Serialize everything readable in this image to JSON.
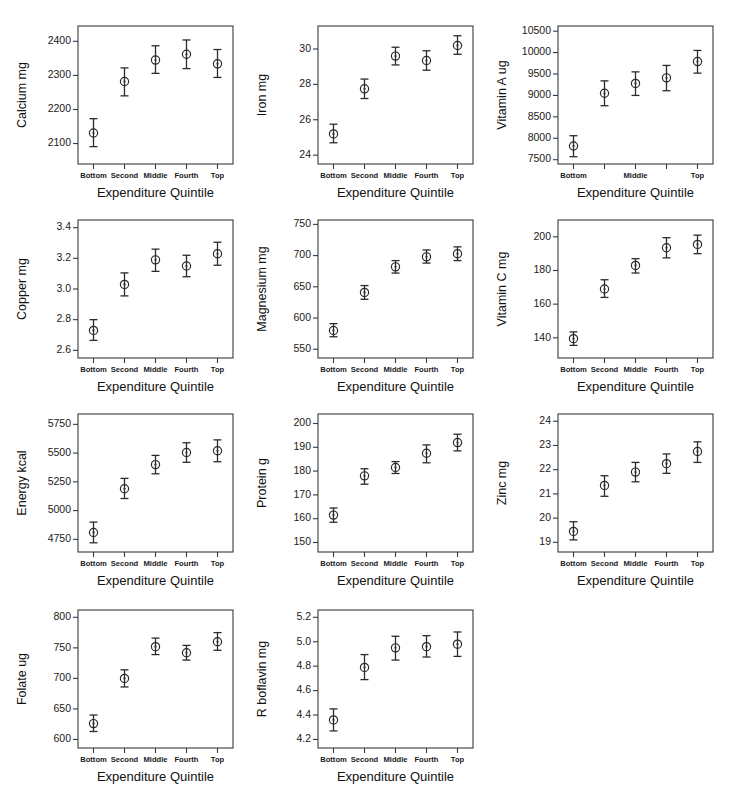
{
  "figure": {
    "layout": {
      "columns": 3,
      "rows": 4,
      "panel_count": 11,
      "empty_cells": [
        11
      ]
    },
    "shared_xlabel": "Expenditure Quintile",
    "shared_categories": [
      "Bottom",
      "Second",
      "Middle",
      "Fourth",
      "Top"
    ],
    "marker": "open-circle-with-center-dot",
    "error_bars": "capped-vertical",
    "grid": false,
    "legend": null,
    "colors": {
      "ink": "#2b2b2b",
      "axis": "#3a3a3a",
      "background": "#ffffff"
    }
  },
  "chart_data": [
    {
      "type": "scatter",
      "title": "",
      "xlabel": "Expenditure Quintile",
      "ylabel": "Calcium mg",
      "categories": [
        "Bottom",
        "Second",
        "Middle",
        "Fourth",
        "Top"
      ],
      "xtick_labels": [
        "Bottom",
        "Second",
        "Middle",
        "Fourth",
        "Top"
      ],
      "values": [
        2131,
        2282,
        2345,
        2362,
        2334
      ],
      "err_low": [
        2091,
        2240,
        2306,
        2320,
        2294
      ],
      "err_high": [
        2173,
        2322,
        2387,
        2404,
        2376
      ],
      "ylim": [
        2040,
        2445
      ],
      "yticks": [
        2100,
        2200,
        2300,
        2400
      ],
      "ytick_labels": [
        "2100",
        "2200",
        "2300",
        "2400"
      ]
    },
    {
      "type": "scatter",
      "title": "",
      "xlabel": "Expenditure Quintile",
      "ylabel": "Iron mg",
      "categories": [
        "Bottom",
        "Second",
        "Middle",
        "Fourth",
        "Top"
      ],
      "xtick_labels": [
        "Bottom",
        "Second",
        "Middle",
        "Fourth",
        "Top"
      ],
      "values": [
        25.2,
        27.75,
        29.6,
        29.35,
        30.2
      ],
      "err_low": [
        24.7,
        27.2,
        29.1,
        28.8,
        29.7
      ],
      "err_high": [
        25.75,
        28.3,
        30.1,
        29.9,
        30.75
      ],
      "ylim": [
        23.5,
        31.3
      ],
      "yticks": [
        24,
        26,
        28,
        30
      ],
      "ytick_labels": [
        "24",
        "26",
        "28",
        "30"
      ]
    },
    {
      "type": "scatter",
      "title": "",
      "xlabel": "Expenditure Quintile",
      "ylabel": "Vitamin A ug",
      "categories": [
        "Bottom",
        "Second",
        "Middle",
        "Fourth",
        "Top"
      ],
      "xtick_labels": [
        "Bottom",
        "",
        "Middle",
        "",
        "Top"
      ],
      "values": [
        7820,
        9050,
        9280,
        9410,
        9790
      ],
      "err_low": [
        7570,
        8760,
        9000,
        9110,
        9520
      ],
      "err_high": [
        8060,
        9340,
        9550,
        9700,
        10050
      ],
      "ylim": [
        7400,
        10620
      ],
      "yticks": [
        7500,
        8000,
        8500,
        9000,
        9500,
        10000,
        10500
      ],
      "ytick_labels": [
        "7500",
        "8000",
        "8500",
        "9000",
        "9500",
        "10000",
        "10500"
      ]
    },
    {
      "type": "scatter",
      "title": "",
      "xlabel": "Expenditure Quintile",
      "ylabel": "Copper mg",
      "categories": [
        "Bottom",
        "Second",
        "Middle",
        "Fourth",
        "Top"
      ],
      "xtick_labels": [
        "Bottom",
        "Second",
        "Middle",
        "Fourth",
        "Top"
      ],
      "values": [
        2.73,
        3.03,
        3.19,
        3.15,
        3.23
      ],
      "err_low": [
        2.665,
        2.955,
        3.115,
        3.08,
        3.155
      ],
      "err_high": [
        2.8,
        3.105,
        3.26,
        3.22,
        3.305
      ],
      "ylim": [
        2.55,
        3.45
      ],
      "yticks": [
        2.6,
        2.8,
        3.0,
        3.2,
        3.4
      ],
      "ytick_labels": [
        "2.6",
        "2.8",
        "3.0",
        "3.2",
        "3.4"
      ]
    },
    {
      "type": "scatter",
      "title": "",
      "xlabel": "Expenditure Quintile",
      "ylabel": "Magnesium mg",
      "categories": [
        "Bottom",
        "Second",
        "Middle",
        "Fourth",
        "Top"
      ],
      "xtick_labels": [
        "Bottom",
        "Second",
        "Middle",
        "Fourth",
        "Top"
      ],
      "values": [
        580,
        641,
        682,
        698,
        703
      ],
      "err_low": [
        570,
        630,
        672,
        688,
        692
      ],
      "err_high": [
        591,
        652,
        692,
        709,
        714
      ],
      "ylim": [
        536,
        757
      ],
      "yticks": [
        550,
        600,
        650,
        700,
        750
      ],
      "ytick_labels": [
        "550",
        "600",
        "650",
        "700",
        "750"
      ]
    },
    {
      "type": "scatter",
      "title": "",
      "xlabel": "Expenditure Quintile",
      "ylabel": "Vitamin C mg",
      "categories": [
        "Bottom",
        "Second",
        "Middle",
        "Fourth",
        "Top"
      ],
      "xtick_labels": [
        "Bottom",
        "Second",
        "Middle",
        "Fourth",
        "Top"
      ],
      "values": [
        139.5,
        169,
        183,
        193.5,
        195.5
      ],
      "err_low": [
        135.5,
        164,
        178.5,
        187.5,
        190
      ],
      "err_high": [
        143.5,
        174.5,
        187,
        199.5,
        201
      ],
      "ylim": [
        128,
        210
      ],
      "yticks": [
        140,
        160,
        180,
        200
      ],
      "ytick_labels": [
        "140",
        "160",
        "180",
        "200"
      ]
    },
    {
      "type": "scatter",
      "title": "",
      "xlabel": "Expenditure Quintile",
      "ylabel": "Energy kcal",
      "categories": [
        "Bottom",
        "Second",
        "Middle",
        "Fourth",
        "Top"
      ],
      "xtick_labels": [
        "Bottom",
        "Second",
        "Middle",
        "Fourth",
        "Top"
      ],
      "values": [
        4810,
        5190,
        5400,
        5505,
        5520
      ],
      "err_low": [
        4720,
        5105,
        5320,
        5420,
        5425
      ],
      "err_high": [
        4900,
        5280,
        5480,
        5590,
        5615
      ],
      "ylim": [
        4640,
        5840
      ],
      "yticks": [
        4750,
        5000,
        5250,
        5500,
        5750
      ],
      "ytick_labels": [
        "4750",
        "5000",
        "5250",
        "5500",
        "5750"
      ]
    },
    {
      "type": "scatter",
      "title": "",
      "xlabel": "Expenditure Quintile",
      "ylabel": "Protein g",
      "categories": [
        "Bottom",
        "Second",
        "Middle",
        "Fourth",
        "Top"
      ],
      "xtick_labels": [
        "Bottom",
        "Second",
        "Middle",
        "Fourth",
        "Top"
      ],
      "values": [
        161.5,
        178,
        181.5,
        187.5,
        192
      ],
      "err_low": [
        158.5,
        174.5,
        179,
        183.5,
        188.5
      ],
      "err_high": [
        164.5,
        181,
        184,
        191,
        195.5
      ],
      "ylim": [
        146,
        204
      ],
      "yticks": [
        150,
        160,
        170,
        180,
        190,
        200
      ],
      "ytick_labels": [
        "150",
        "160",
        "170",
        "180",
        "190",
        "200"
      ]
    },
    {
      "type": "scatter",
      "title": "",
      "xlabel": "Expenditure Quintile",
      "ylabel": "Zinc mg",
      "categories": [
        "Bottom",
        "Second",
        "Middle",
        "Fourth",
        "Top"
      ],
      "xtick_labels": [
        "Bottom",
        "Second",
        "Middle",
        "Fourth",
        "Top"
      ],
      "values": [
        19.45,
        21.35,
        21.9,
        22.25,
        22.75
      ],
      "err_low": [
        19.1,
        20.9,
        21.5,
        21.85,
        22.3
      ],
      "err_high": [
        19.85,
        21.75,
        22.3,
        22.65,
        23.15
      ],
      "ylim": [
        18.6,
        24.3
      ],
      "yticks": [
        19,
        20,
        21,
        22,
        23,
        24
      ],
      "ytick_labels": [
        "19",
        "20",
        "21",
        "22",
        "23",
        "24"
      ]
    },
    {
      "type": "scatter",
      "title": "",
      "xlabel": "Expenditure Quintile",
      "ylabel": "Folate ug",
      "categories": [
        "Bottom",
        "Second",
        "Middle",
        "Fourth",
        "Top"
      ],
      "xtick_labels": [
        "Bottom",
        "Second",
        "Middle",
        "Fourth",
        "Top"
      ],
      "values": [
        626,
        700,
        752,
        742,
        760
      ],
      "err_low": [
        613,
        686,
        739,
        730,
        746
      ],
      "err_high": [
        640,
        714,
        766,
        754,
        775
      ],
      "ylim": [
        586,
        812
      ],
      "yticks": [
        600,
        650,
        700,
        750,
        800
      ],
      "ytick_labels": [
        "600",
        "650",
        "700",
        "750",
        "800"
      ]
    },
    {
      "type": "scatter",
      "title": "",
      "xlabel": "Expenditure Quintile",
      "ylabel": "R boflavin mg",
      "categories": [
        "Bottom",
        "Second",
        "Middle",
        "Fourth",
        "Top"
      ],
      "xtick_labels": [
        "Bottom",
        "Second",
        "Middle",
        "Fourth",
        "Top"
      ],
      "values": [
        4.36,
        4.79,
        4.95,
        4.96,
        4.98
      ],
      "err_low": [
        4.27,
        4.69,
        4.85,
        4.875,
        4.88
      ],
      "err_high": [
        4.45,
        4.895,
        5.045,
        5.05,
        5.08
      ],
      "ylim": [
        4.13,
        5.26
      ],
      "yticks": [
        4.2,
        4.4,
        4.6,
        4.8,
        5.0,
        5.2
      ],
      "ytick_labels": [
        "4.2",
        "4.4",
        "4.6",
        "4.8",
        "5.0",
        "5.2"
      ]
    }
  ]
}
